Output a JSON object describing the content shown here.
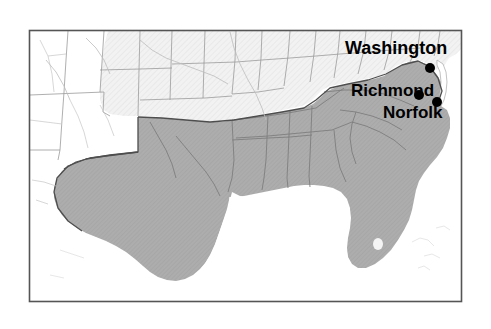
{
  "map": {
    "title": "Southern United States region map",
    "frame": {
      "x": 29,
      "y": 30,
      "width": 433,
      "height": 272,
      "border_color": "#555555"
    },
    "colors": {
      "highlight_fill": "#ADADAD",
      "secondary_fill": "#EFEFEF",
      "plain_fill": "#FFFFFF",
      "state_border": "#8A8A8A",
      "region_border": "#4A4A4A",
      "water": "#FFFFFF",
      "label_color": "#000000",
      "dot_color": "#000000",
      "background": "#FFFFFF"
    },
    "legend_regions": [
      {
        "name": "highlighted-south",
        "fill": "#ADADAD",
        "description": "Southern states shaded dark gray"
      },
      {
        "name": "midwest-plains",
        "fill": "#EFEFEF",
        "description": "Midwest and plains states shaded light gray"
      },
      {
        "name": "west",
        "fill": "#FFFFFF",
        "description": "Western states unshaded"
      }
    ],
    "cities": [
      {
        "id": "washington",
        "label": "Washington",
        "dot_x": 430,
        "dot_y": 68,
        "dot_r": 5
      },
      {
        "id": "richmond",
        "label": "Richmond",
        "dot_x": 419,
        "dot_y": 95,
        "dot_r": 5
      },
      {
        "id": "norfolk",
        "label": "Norfolk",
        "dot_x": 437,
        "dot_y": 102,
        "dot_r": 5
      }
    ]
  }
}
